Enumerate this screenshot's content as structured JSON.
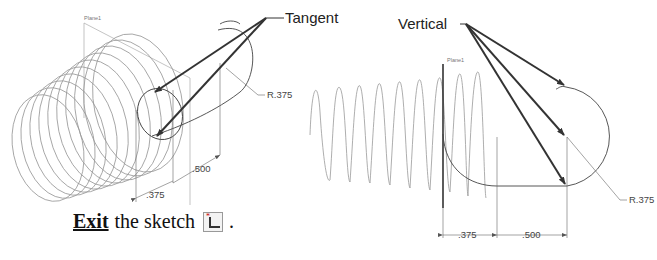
{
  "left_view": {
    "plane_label": "Plane1",
    "callout": "Tangent",
    "radius_label": "R.375",
    "dim_horizontal": ".375",
    "dim_vertical": ".500"
  },
  "right_view": {
    "plane_label": "Plane1",
    "callout": "Vertical",
    "radius_label": "R.375",
    "dim_left": ".375",
    "dim_right": ".500"
  },
  "instruction": {
    "keyword": "Exit",
    "text": "the sketch",
    "period": ".",
    "icon": "exit-sketch-icon"
  },
  "colors": {
    "leader": "#333333",
    "geometry": "#555555",
    "helix": "#999999",
    "dimension": "#666666"
  }
}
